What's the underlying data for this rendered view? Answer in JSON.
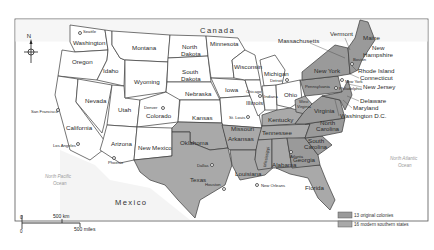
{
  "map": {
    "countries": {
      "north": "Canada",
      "south": "Mexico"
    },
    "oceans": {
      "pacific": [
        "North Pacific",
        "Ocean"
      ],
      "atlantic": [
        "North Atlantic",
        "Ocean"
      ]
    },
    "compass": {
      "label": "N"
    },
    "scale": {
      "zero_top": "0",
      "zero_bottom": "0",
      "km": "500 km",
      "miles": "500 miles"
    },
    "legend": {
      "items": [
        {
          "label": "13 original colonies",
          "color": "#9a9a9a"
        },
        {
          "label": "16 modern southern states",
          "color": "#a9a9a9"
        }
      ]
    },
    "states": {
      "washington": "Washington",
      "oregon": "Oregon",
      "california": "California",
      "idaho": "Idaho",
      "nevada": "Nevada",
      "utah": "Utah",
      "arizona": "Arizona",
      "montana": "Montana",
      "wyoming": "Wyoming",
      "colorado": "Colorado",
      "new_mexico": "New Mexico",
      "north_dakota_1": "North",
      "north_dakota_2": "Dakota",
      "south_dakota_1": "South",
      "south_dakota_2": "Dakota",
      "nebraska": "Nebraska",
      "kansas": "Kansas",
      "oklahoma": "Oklahoma",
      "texas": "Texas",
      "minnesota": "Minnesota",
      "iowa": "Iowa",
      "missouri": "Missouri",
      "arkansas": "Arkansas",
      "louisiana": "Louisiana",
      "wisconsin": "Wisconsin",
      "illinois": "Illinois",
      "michigan": "Michigan",
      "indiana": "Indiana",
      "ohio": "Ohio",
      "kentucky": "Kentucky",
      "tennessee": "Tennessee",
      "mississippi": "Mississippi",
      "alabama": "Alabama",
      "georgia": "Georgia",
      "florida": "Florida",
      "south_carolina_1": "South",
      "south_carolina_2": "Carolina",
      "north_carolina_1": "North",
      "north_carolina_2": "Carolina",
      "virginia": "Virginia",
      "west_virginia_1": "West",
      "west_virginia_2": "Virginia",
      "pennsylvania": "Pennsylvania",
      "new_york": "New York",
      "vermont": "Vermont",
      "massachusetts": "Massachusetts",
      "maine": "Maine",
      "new_hampshire_1": "New",
      "new_hampshire_2": "Hampshire",
      "rhode_island": "Rhode Island",
      "connecticut": "Connecticut",
      "new_jersey": "New Jersey",
      "delaware": "Delaware",
      "maryland": "Maryland",
      "washington_dc": "Washington D.C."
    },
    "cities": {
      "seattle": "Seattle",
      "san_francisco": "San Francisco",
      "los_angeles": "Los Angeles",
      "phoenix": "Phoenix",
      "denver": "Denver",
      "dallas": "Dallas",
      "houston": "Houston",
      "new_orleans": "New Orleans",
      "st_louis": "St. Louis",
      "chicago": "Chicago",
      "detroit": "Detroit",
      "atlanta": "Atlanta",
      "boston": "Boston",
      "new_york_city": "New York",
      "philadelphia": "Philadelphia"
    }
  }
}
